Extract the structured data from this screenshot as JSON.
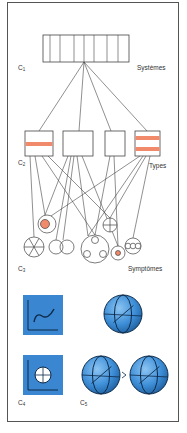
{
  "labels": {
    "c1": {
      "letter": "C",
      "index": "1"
    },
    "c2": {
      "letter": "C",
      "index": "2"
    },
    "c3": {
      "letter": "C",
      "index": "3"
    },
    "c4": {
      "letter": "C",
      "index": "4"
    },
    "c5": {
      "letter": "C",
      "index": "5"
    },
    "systems": "Systèmes",
    "types": "Types",
    "symptoms": "Symptômes"
  },
  "colors": {
    "line": "#444444",
    "accent_orange": "#f08a6a",
    "panel_blue": "#3a86d0",
    "sphere_blue": "#4a9ae0",
    "sphere_dark": "#0d2a4a"
  },
  "systems_box": {
    "cells": 8
  },
  "types": [
    {
      "name": "type-1",
      "bands": 1
    },
    {
      "name": "type-2",
      "bands": 0
    },
    {
      "name": "type-3",
      "bands": 0
    },
    {
      "name": "type-4",
      "bands": 2
    }
  ],
  "symptoms": [
    {
      "name": "spoked-wheel"
    },
    {
      "name": "circle-with-orange-dot"
    },
    {
      "name": "double-circle"
    },
    {
      "name": "circle-with-three-holes"
    },
    {
      "name": "circle-with-cross"
    },
    {
      "name": "small-circle-with-orange-dot"
    },
    {
      "name": "triple-ring"
    }
  ]
}
